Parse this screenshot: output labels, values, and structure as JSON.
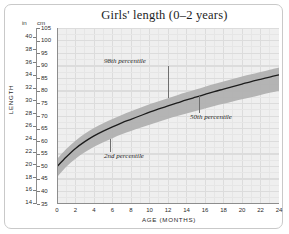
{
  "chart_data": {
    "type": "line",
    "title": "Girls' length (0–2 years)",
    "xlabel": "AGE (MONTHS)",
    "ylabel": "LENGTH",
    "grid": true,
    "legend_position": "inline-annotations",
    "x": [
      0,
      1,
      2,
      3,
      4,
      5,
      6,
      7,
      8,
      9,
      10,
      11,
      12,
      13,
      14,
      15,
      16,
      17,
      18,
      19,
      20,
      21,
      22,
      23,
      24
    ],
    "xlim": [
      0,
      24
    ],
    "xticks": [
      0,
      2,
      4,
      6,
      8,
      10,
      12,
      14,
      16,
      18,
      20,
      22,
      24
    ],
    "y_primary_unit": "cm",
    "ylim_cm": [
      35,
      105
    ],
    "yticks_cm": [
      35,
      40,
      45,
      50,
      55,
      60,
      65,
      70,
      75,
      80,
      85,
      90,
      95,
      100,
      105
    ],
    "y_secondary_unit": "in",
    "ylim_in": [
      14,
      41.34
    ],
    "yticks_in": [
      14,
      16,
      18,
      20,
      22,
      24,
      26,
      28,
      30,
      32,
      34,
      36,
      38,
      40
    ],
    "unit_header_left": "in",
    "unit_header_right": "cm",
    "series": [
      {
        "name": "98th percentile",
        "role": "upper-band",
        "values": [
          52.9,
          56.9,
          60.2,
          62.9,
          65.2,
          67.1,
          68.8,
          70.4,
          71.9,
          73.3,
          74.7,
          75.9,
          77.1,
          78.3,
          79.4,
          80.5,
          81.6,
          82.7,
          83.7,
          84.7,
          85.7,
          86.6,
          87.5,
          88.4,
          89.3
        ]
      },
      {
        "name": "50th percentile",
        "role": "median-line",
        "values": [
          49.9,
          53.7,
          57.1,
          59.8,
          62.1,
          64.0,
          65.7,
          67.3,
          68.7,
          70.1,
          71.5,
          72.8,
          74.0,
          75.2,
          76.4,
          77.5,
          78.6,
          79.7,
          80.7,
          81.7,
          82.7,
          83.7,
          84.6,
          85.5,
          86.4
        ]
      },
      {
        "name": "2nd percentile",
        "role": "lower-band",
        "values": [
          45.6,
          49.8,
          53.0,
          55.6,
          57.8,
          59.6,
          61.2,
          62.7,
          64.0,
          65.3,
          66.5,
          67.7,
          68.9,
          70.0,
          71.0,
          72.0,
          73.0,
          74.0,
          74.9,
          75.8,
          76.7,
          77.5,
          78.4,
          79.2,
          80.0
        ]
      }
    ],
    "annotations": [
      {
        "text": "98th percentile",
        "anchor_month": 12.0
      },
      {
        "text": "50th percentile",
        "anchor_month": 15.3
      },
      {
        "text": "2nd percentile",
        "anchor_month": 5.7
      }
    ],
    "colors": {
      "band": "#b0b0b0",
      "median_line": "#1c1c1c",
      "plot_background": "#efefef",
      "gridline": "#e3e3e3",
      "axis": "#8d8d8d",
      "text": "#1d1d1d",
      "frame": "#c9c9c9"
    }
  }
}
